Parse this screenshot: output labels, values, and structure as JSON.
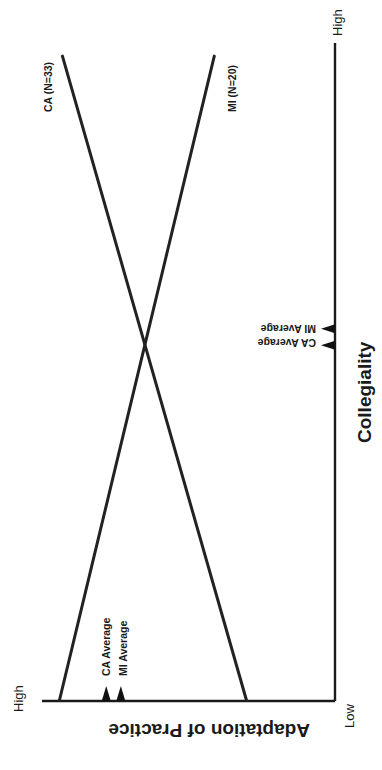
{
  "chart_data": {
    "type": "line",
    "orientation": "rotated 90deg clockwise (x-axis vertical on right, y-axis horizontal on bottom)",
    "title": "",
    "xlabel": "Collegiality",
    "ylabel": "Adaptation of Practice",
    "x_ticks": {
      "low": "Low",
      "high": "High"
    },
    "y_ticks": {
      "low": "Low",
      "high": "High"
    },
    "xlim": [
      0,
      1
    ],
    "ylim": [
      0,
      1
    ],
    "grid": false,
    "legend": "inline labels at line ends",
    "series": [
      {
        "name": "CA (N=33)",
        "x": [
          0.0,
          0.98
        ],
        "y": [
          0.3,
          0.93
        ]
      },
      {
        "name": "MI (N=20)",
        "x": [
          0.0,
          0.98
        ],
        "y": [
          0.94,
          0.41
        ]
      }
    ],
    "averages": {
      "collegiality": [
        {
          "label": "MI Average",
          "value": 0.565
        },
        {
          "label": "CA Average",
          "value": 0.54
        }
      ],
      "adaptation": [
        {
          "label": "CA Average",
          "value": 0.78
        },
        {
          "label": "MI Average",
          "value": 0.73
        }
      ]
    },
    "annotations": [
      "CA Average",
      "MI Average"
    ]
  },
  "labels": {
    "x_axis_title": "Collegiality",
    "y_axis_title": "Adaptation of Practice",
    "x_high": "High",
    "x_low": "Low",
    "y_high": "High",
    "ca_series": "CA (N=33)",
    "mi_series": "MI (N=20)",
    "ca_avg_x": "CA Average",
    "mi_avg_x": "MI Average",
    "ca_avg_y": "CA Average",
    "mi_avg_y": "MI Average"
  },
  "colors": {
    "ink": "#1a1a1a",
    "background": "#ffffff"
  }
}
